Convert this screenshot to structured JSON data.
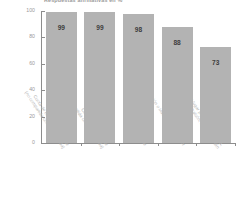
{
  "chart_data": {
    "type": "bar",
    "title": "Respuestas afirmativas en %",
    "xlabel": "",
    "ylabel": "",
    "ylim": [
      0,
      100
    ],
    "yticks": [
      0,
      20,
      40,
      60,
      80,
      100
    ],
    "grid": false,
    "legend": "none",
    "bar_color": "#b3b3b3",
    "categories": [
      "Cuota de baño independiente (no compartida con otra vivienda)",
      "Cocina independiente (no compartida con otra vivienda)",
      "Agua caliente",
      "Calefacción o instalaciones de calor",
      "Un lugar para sentarse fuera, por ejemplo, balcón, terraza o jardín"
    ],
    "category_lines": [
      [
        "Cuota de baño independiente",
        "(no compartida con otra vivienda)"
      ],
      [
        "Cocina independiente",
        "(no compartida con otra vivienda)"
      ],
      [
        "Agua caliente",
        ""
      ],
      [
        "Calefacción o instalaciones de calor",
        ""
      ],
      [
        "Un lugar para sentarse fuera,",
        "por ejemplo, balcón, terraza o jardín"
      ]
    ],
    "values": [
      99,
      99,
      98,
      88,
      73
    ],
    "value_labels": [
      "99",
      "99",
      "98",
      "88",
      "73"
    ]
  }
}
